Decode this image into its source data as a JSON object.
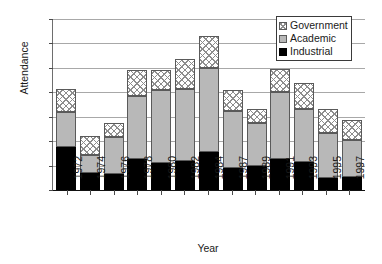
{
  "chart_data": {
    "type": "bar",
    "stacked": true,
    "title": "",
    "xlabel": "Year",
    "ylabel": "Attendance",
    "ylim": [
      0,
      140
    ],
    "yticks": [
      0,
      20,
      40,
      60,
      80,
      100,
      120,
      140
    ],
    "grid": true,
    "legend_position": "top-right",
    "categories": [
      "1972",
      "1974",
      "1976",
      "1978",
      "1980",
      "1982",
      "1984",
      "1987",
      "1989",
      "1991",
      "1993",
      "1995",
      "1997"
    ],
    "series": [
      {
        "name": "Industrial",
        "color": "#000000",
        "values": [
          35,
          14,
          13,
          25,
          22,
          24,
          31,
          18,
          20,
          25,
          23,
          10,
          11
        ]
      },
      {
        "name": "Academic",
        "color": "#b8b8b8",
        "values": [
          29,
          15,
          30,
          52,
          60,
          59,
          69,
          47,
          35,
          55,
          43,
          37,
          30
        ]
      },
      {
        "name": "Government",
        "color": "#ffffff",
        "values": [
          19,
          15,
          12,
          21,
          16,
          24,
          26,
          17,
          11,
          19,
          22,
          19,
          16
        ]
      }
    ],
    "totals": [
      83,
      44,
      55,
      98,
      98,
      107,
      126,
      82,
      66,
      99,
      88,
      66,
      57
    ]
  },
  "legend": {
    "items": [
      {
        "label": "Government",
        "swatch": "crosshatch-swatch"
      },
      {
        "label": "Academic",
        "swatch": "gray-swatch"
      },
      {
        "label": "Industrial",
        "swatch": "black-swatch"
      }
    ]
  }
}
